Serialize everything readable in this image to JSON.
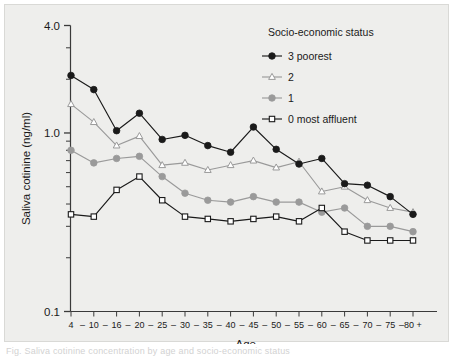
{
  "figure": {
    "background_color": "#eeeeec",
    "page_color": "#ffffff",
    "caption_fragment": "Fig. Saliva cotinine concentration by age and socio-economic status"
  },
  "axes": {
    "y_title": "Saliva cotinine (ng/ml)",
    "x_title": "Age",
    "y_tick_labels": [
      "4.0",
      "1.0",
      "0.1"
    ],
    "y_tick_values": [
      4.0,
      1.0,
      0.1
    ],
    "x_tick_labels": [
      "4",
      "10",
      "16",
      "20",
      "25",
      "30",
      "35",
      "40",
      "45",
      "50",
      "55",
      "60",
      "65",
      "70",
      "75",
      "80 +"
    ],
    "x_separator": "–"
  },
  "legend": {
    "title": "Socio-economic status",
    "entries": [
      {
        "label": "3 poorest",
        "marker": "filled-circle",
        "color": "#1a1a1a",
        "fill": "#1a1a1a"
      },
      {
        "label": "2",
        "marker": "open-triangle",
        "color": "#9a9a9a",
        "fill": "#ffffff"
      },
      {
        "label": "1",
        "marker": "filled-circle",
        "color": "#9a9a9a",
        "fill": "#9a9a9a"
      },
      {
        "label": "0 most affluent",
        "marker": "open-square",
        "color": "#1a1a1a",
        "fill": "#ffffff"
      }
    ]
  },
  "chart_data": {
    "type": "line",
    "title": "",
    "xlabel": "Age",
    "ylabel": "Saliva cotinine (ng/ml)",
    "yscale": "log",
    "ylim": [
      0.1,
      4.0
    ],
    "grid": false,
    "legend_position": "top-right",
    "legend_title": "Socio-economic status",
    "categories": [
      "4",
      "10",
      "16",
      "20",
      "25",
      "30",
      "35",
      "40",
      "45",
      "50",
      "55",
      "60",
      "65",
      "70",
      "75",
      "80 +"
    ],
    "series": [
      {
        "name": "3 poorest",
        "marker": "filled-circle",
        "color": "#1a1a1a",
        "values": [
          2.1,
          1.75,
          1.03,
          1.29,
          0.92,
          0.97,
          0.85,
          0.78,
          1.08,
          0.81,
          0.67,
          0.72,
          0.52,
          0.51,
          0.44,
          0.35
        ]
      },
      {
        "name": "2",
        "marker": "open-triangle",
        "color": "#9a9a9a",
        "values": [
          1.45,
          1.15,
          0.85,
          0.96,
          0.66,
          0.68,
          0.62,
          0.66,
          0.7,
          0.64,
          0.69,
          0.47,
          0.5,
          0.42,
          0.38,
          0.36
        ]
      },
      {
        "name": "1",
        "marker": "filled-circle",
        "color": "#9a9a9a",
        "values": [
          0.8,
          0.68,
          0.72,
          0.74,
          0.57,
          0.46,
          0.42,
          0.41,
          0.44,
          0.41,
          0.41,
          0.36,
          0.38,
          0.3,
          0.3,
          0.28
        ]
      },
      {
        "name": "0 most affluent",
        "marker": "open-square",
        "color": "#1a1a1a",
        "values": [
          0.35,
          0.34,
          0.48,
          0.57,
          0.42,
          0.34,
          0.33,
          0.32,
          0.33,
          0.34,
          0.32,
          0.38,
          0.28,
          0.25,
          0.25,
          0.25
        ]
      }
    ]
  }
}
